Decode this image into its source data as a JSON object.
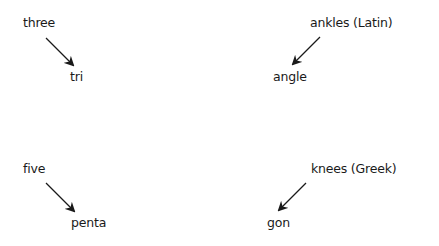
{
  "diagram": {
    "groups": [
      {
        "source": "three",
        "target": "tri",
        "direction": "down-right"
      },
      {
        "source": "ankles (Latin)",
        "target": "angle",
        "direction": "down-left"
      },
      {
        "source": "five",
        "target": "penta",
        "direction": "down-right"
      },
      {
        "source": "knees (Greek)",
        "target": "gon",
        "direction": "down-left"
      }
    ],
    "arrow_color": "#1a1a1a",
    "text_color": "#1a1a1a",
    "background": "#ffffff"
  }
}
